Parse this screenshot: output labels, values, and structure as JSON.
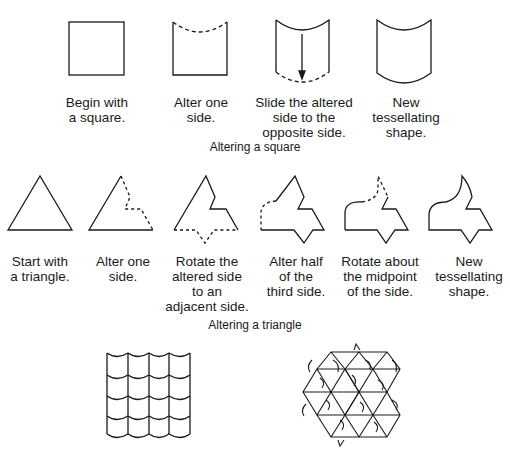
{
  "square_section": {
    "caption": "Altering a square",
    "steps": [
      {
        "label": "Begin with\na square."
      },
      {
        "label": "Alter one\nside."
      },
      {
        "label": "Slide the altered\nside to the\nopposite side."
      },
      {
        "label": "New\ntessellating\nshape."
      }
    ]
  },
  "triangle_section": {
    "caption": "Altering a triangle",
    "steps": [
      {
        "label": "Start with\na triangle."
      },
      {
        "label": "Alter one\nside."
      },
      {
        "label": "Rotate the\naltered side\nto an\nadjacent side."
      },
      {
        "label": "Alter half\nof the\nthird side."
      },
      {
        "label": "Rotate about\nthe midpoint\nof the side."
      },
      {
        "label": "New\ntessellating\nshape."
      }
    ]
  },
  "tessellations": [
    {
      "name": "square-based tessellation",
      "rows": 4,
      "cols": 4
    },
    {
      "name": "triangle-based tessellation"
    }
  ],
  "colors": {
    "line": "#1a1a1a",
    "background": "#ffffff"
  }
}
